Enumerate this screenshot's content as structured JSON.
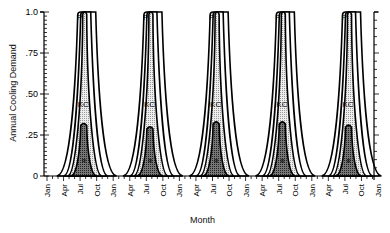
{
  "chart_data": {
    "type": "area",
    "title": "",
    "xlabel": "Month",
    "ylabel": "Annual Cooling Demand",
    "ylim": [
      0,
      1.0
    ],
    "yticks": [
      "0",
      ".25",
      ".50",
      ".75",
      "1.0"
    ],
    "ytick_values": [
      0,
      0.25,
      0.5,
      0.75,
      1.0
    ],
    "x_tick_labels": [
      "Jan",
      "Apr",
      "Jul",
      "Oct",
      "Jan",
      "Apr",
      "Jul",
      "Oct",
      "Jan",
      "Apr",
      "Jul",
      "Oct",
      "Jan",
      "Apr",
      "Jul",
      "Oct",
      "Jan",
      "Apr",
      "Jul",
      "Oct",
      "Jan"
    ],
    "years": 5,
    "grid": false,
    "legend": "inline labels",
    "series": [
      {
        "name": "P",
        "label": "P",
        "description": "potential (outer envelope, flat-topped at 1.0)",
        "peak_values": [
          1.0,
          1.0,
          1.0,
          1.0,
          1.0
        ],
        "fill": "#ffffff"
      },
      {
        "name": "KC",
        "label": "KC",
        "description": "middle band, peaks at 1.0",
        "peak_values": [
          1.0,
          1.0,
          1.0,
          1.0,
          1.0
        ],
        "fill": "#d8d8d8"
      },
      {
        "name": "R",
        "label": "R",
        "description": "inner dark band",
        "peak_values": [
          0.32,
          0.3,
          0.33,
          0.33,
          0.31
        ],
        "fill": "#8a8a8a"
      }
    ]
  },
  "axes": {
    "xlabel": "Month",
    "ylabel": "Annual Cooling Demand"
  }
}
